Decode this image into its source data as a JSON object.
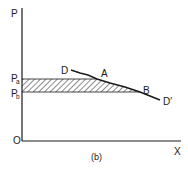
{
  "figure": {
    "caption": "(b)",
    "axes": {
      "y_label": "P",
      "x_label": "X",
      "origin_label": "O"
    },
    "price_levels": [
      {
        "base": "P",
        "sub": "a"
      },
      {
        "base": "P",
        "sub": "b"
      }
    ],
    "curve": {
      "start_label": "D",
      "end_label": "D′",
      "points": [
        {
          "label": "A"
        },
        {
          "label": "B"
        }
      ]
    },
    "shaded_region": "hatched band between Pa and Pb up to the curve"
  },
  "colors": {
    "ink": "#1a1a1a",
    "background": "#ffffff"
  }
}
